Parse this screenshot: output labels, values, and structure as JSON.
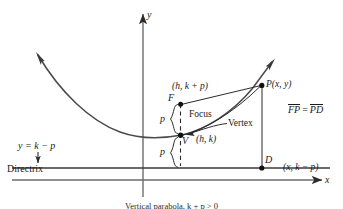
{
  "figure": {
    "type": "parabola-geometry-diagram",
    "caption": "Vertical parabola, k + p > 0",
    "axes": {
      "x_label": "x",
      "y_label": "y",
      "x_axis_y": 180,
      "y_axis_x": 143
    },
    "directrix": {
      "label": "Directrix",
      "equation": "y = k − p",
      "line_y": 168
    },
    "points": [
      {
        "name": "F",
        "label": "F",
        "coord_label": "(h, k + p)",
        "role": "Focus",
        "x": 180,
        "y": 104
      },
      {
        "name": "V",
        "label": "V",
        "coord_label": "(h, k)",
        "role": "Vertex",
        "x": 180,
        "y": 135
      },
      {
        "name": "P",
        "label": "P(x, y)",
        "coord_label": "",
        "role": "Point on parabola",
        "x": 262,
        "y": 85
      },
      {
        "name": "D",
        "label": "D",
        "coord_label": "(x, k − p)",
        "role": "Foot on directrix",
        "x": 262,
        "y": 168
      }
    ],
    "annotations": {
      "focus_label": "Focus",
      "vertex_label": "Vertex",
      "focus_coord": "(h, k + p)",
      "vertex_coord": "(h, k)",
      "point_p_label": "P(x, y)",
      "point_d_label": "D",
      "point_d_coord": "(x, k − p)",
      "focus_point_label": "F",
      "vertex_point_label": "V",
      "brace_upper_label": "p",
      "brace_lower_label": "p"
    },
    "equation": {
      "lhs": "FP",
      "operator": "=",
      "rhs": "PD",
      "full": "FP = PD"
    },
    "colors": {
      "ink": "#1a1a1a",
      "curve": "#3a3a3a",
      "background": "#ffffff"
    }
  }
}
